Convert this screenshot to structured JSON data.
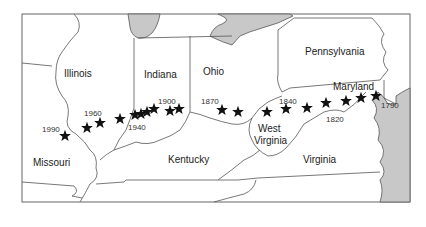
{
  "map": {
    "title": "Mean center of U.S. population, 1790–1990",
    "colors": {
      "land": "#ffffff",
      "water": "#c8c8c8",
      "border": "#555555",
      "marker": "#111111"
    },
    "states": [
      {
        "name": "Illinois",
        "x": 64,
        "y": 77
      },
      {
        "name": "Indiana",
        "x": 144,
        "y": 78
      },
      {
        "name": "Ohio",
        "x": 203,
        "y": 75
      },
      {
        "name": "Pennsylvania",
        "x": 305,
        "y": 55
      },
      {
        "name": "Maryland",
        "x": 333,
        "y": 90
      },
      {
        "name": "West",
        "x": 258,
        "y": 132
      },
      {
        "name": "Virginia",
        "x": 254,
        "y": 144
      },
      {
        "name": "Virginia",
        "x": 303,
        "y": 163
      },
      {
        "name": "Kentucky",
        "x": 168,
        "y": 163
      },
      {
        "name": "Missouri",
        "x": 33,
        "y": 166
      }
    ],
    "year_labels": [
      {
        "year": "1990",
        "x": 42,
        "y": 132
      },
      {
        "year": "1960",
        "x": 84,
        "y": 116
      },
      {
        "year": "1940",
        "x": 128,
        "y": 130
      },
      {
        "year": "1900",
        "x": 158,
        "y": 104
      },
      {
        "year": "1870",
        "x": 201,
        "y": 104
      },
      {
        "year": "1840",
        "x": 279,
        "y": 104
      },
      {
        "year": "1820",
        "x": 326,
        "y": 122
      },
      {
        "year": "1790",
        "x": 381,
        "y": 108
      }
    ],
    "markers": [
      {
        "x": 65,
        "y": 136
      },
      {
        "x": 87,
        "y": 128
      },
      {
        "x": 100,
        "y": 123
      },
      {
        "x": 120,
        "y": 119
      },
      {
        "x": 135,
        "y": 115
      },
      {
        "x": 141,
        "y": 114
      },
      {
        "x": 147,
        "y": 112
      },
      {
        "x": 154,
        "y": 109
      },
      {
        "x": 170,
        "y": 111
      },
      {
        "x": 179,
        "y": 109
      },
      {
        "x": 222,
        "y": 110
      },
      {
        "x": 238,
        "y": 112
      },
      {
        "x": 267,
        "y": 112
      },
      {
        "x": 286,
        "y": 109
      },
      {
        "x": 307,
        "y": 108
      },
      {
        "x": 326,
        "y": 103
      },
      {
        "x": 346,
        "y": 101
      },
      {
        "x": 361,
        "y": 98
      },
      {
        "x": 376,
        "y": 96
      }
    ]
  }
}
